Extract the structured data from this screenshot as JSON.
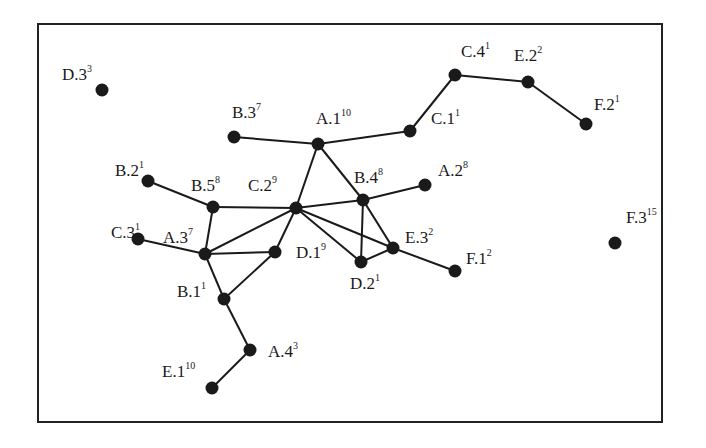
{
  "diagram": {
    "type": "network-graph",
    "node_color": "#1a1a1a",
    "edge_color": "#1a1a1a",
    "border_color": "#222222",
    "nodes": [
      {
        "id": "D.3",
        "name": "D.3",
        "sup": "3",
        "x": 102,
        "y": 90,
        "lx": 62,
        "ly": 80
      },
      {
        "id": "B.3",
        "name": "B.3",
        "sup": "7",
        "x": 234,
        "y": 137,
        "lx": 232,
        "ly": 118
      },
      {
        "id": "A.1",
        "name": "A.1",
        "sup": "10",
        "x": 318,
        "y": 144,
        "lx": 316,
        "ly": 124
      },
      {
        "id": "C.1",
        "name": "C.1",
        "sup": "1",
        "x": 410,
        "y": 131,
        "lx": 431,
        "ly": 124
      },
      {
        "id": "C.4",
        "name": "C.4",
        "sup": "1",
        "x": 455,
        "y": 75,
        "lx": 461,
        "ly": 57
      },
      {
        "id": "E.2",
        "name": "E.2",
        "sup": "2",
        "x": 528,
        "y": 82,
        "lx": 514,
        "ly": 61
      },
      {
        "id": "F.2",
        "name": "F.2",
        "sup": "1",
        "x": 586,
        "y": 124,
        "lx": 594,
        "ly": 110
      },
      {
        "id": "B.2",
        "name": "B.2",
        "sup": "1",
        "x": 148,
        "y": 181,
        "lx": 115,
        "ly": 176
      },
      {
        "id": "B.5",
        "name": "B.5",
        "sup": "8",
        "x": 213,
        "y": 207,
        "lx": 191,
        "ly": 191
      },
      {
        "id": "C.2",
        "name": "C.2",
        "sup": "9",
        "x": 296,
        "y": 208,
        "lx": 248,
        "ly": 191
      },
      {
        "id": "B.4",
        "name": "B.4",
        "sup": "8",
        "x": 363,
        "y": 200,
        "lx": 354,
        "ly": 183
      },
      {
        "id": "A.2",
        "name": "A.2",
        "sup": "8",
        "x": 425,
        "y": 185,
        "lx": 438,
        "ly": 176
      },
      {
        "id": "C.3",
        "name": "C.3",
        "sup": "1",
        "x": 138,
        "y": 239,
        "lx": 111,
        "ly": 238
      },
      {
        "id": "A.3",
        "name": "A.3",
        "sup": "7",
        "x": 205,
        "y": 254,
        "lx": 163,
        "ly": 243
      },
      {
        "id": "D.1",
        "name": "D.1",
        "sup": "9",
        "x": 275,
        "y": 252,
        "lx": 296,
        "ly": 258
      },
      {
        "id": "D.2",
        "name": "D.2",
        "sup": "1",
        "x": 361,
        "y": 262,
        "lx": 350,
        "ly": 289
      },
      {
        "id": "E.3",
        "name": "E.3",
        "sup": "2",
        "x": 393,
        "y": 248,
        "lx": 405,
        "ly": 243
      },
      {
        "id": "F.1",
        "name": "F.1",
        "sup": "2",
        "x": 455,
        "y": 271,
        "lx": 466,
        "ly": 264
      },
      {
        "id": "B.1",
        "name": "B.1",
        "sup": "1",
        "x": 224,
        "y": 299,
        "lx": 177,
        "ly": 297
      },
      {
        "id": "A.4",
        "name": "A.4",
        "sup": "3",
        "x": 250,
        "y": 350,
        "lx": 268,
        "ly": 357
      },
      {
        "id": "E.1",
        "name": "E.1",
        "sup": "10",
        "x": 212,
        "y": 388,
        "lx": 162,
        "ly": 377
      },
      {
        "id": "F.3",
        "name": "F.3",
        "sup": "15",
        "x": 615,
        "y": 243,
        "lx": 626,
        "ly": 223
      }
    ],
    "edges": [
      [
        "B.3",
        "A.1"
      ],
      [
        "A.1",
        "C.1"
      ],
      [
        "C.1",
        "C.4"
      ],
      [
        "C.4",
        "E.2"
      ],
      [
        "E.2",
        "F.2"
      ],
      [
        "A.1",
        "C.2"
      ],
      [
        "A.1",
        "B.4"
      ],
      [
        "B.2",
        "B.5"
      ],
      [
        "B.5",
        "C.2"
      ],
      [
        "B.5",
        "A.3"
      ],
      [
        "C.3",
        "A.3"
      ],
      [
        "A.3",
        "C.2"
      ],
      [
        "A.3",
        "D.1"
      ],
      [
        "A.3",
        "B.1"
      ],
      [
        "C.2",
        "D.1"
      ],
      [
        "C.2",
        "B.4"
      ],
      [
        "C.2",
        "D.2"
      ],
      [
        "C.2",
        "E.3"
      ],
      [
        "B.4",
        "A.2"
      ],
      [
        "B.4",
        "D.2"
      ],
      [
        "B.4",
        "E.3"
      ],
      [
        "D.2",
        "E.3"
      ],
      [
        "E.3",
        "F.1"
      ],
      [
        "B.1",
        "D.1"
      ],
      [
        "B.1",
        "A.4"
      ],
      [
        "A.4",
        "E.1"
      ]
    ]
  }
}
